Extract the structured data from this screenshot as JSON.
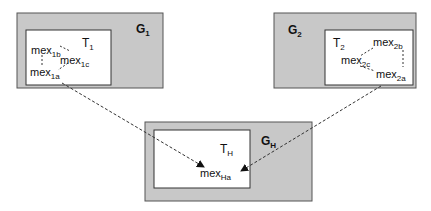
{
  "colors": {
    "outer_fill": "#c8c8c8",
    "outer_stroke": "#555555",
    "inner_fill": "#ffffff",
    "inner_stroke": "#333333",
    "link": "#333333"
  },
  "groups": [
    {
      "id": "G1",
      "label": "G",
      "label_sub": "1",
      "inner_label": "T",
      "inner_label_sub": "1",
      "nodes": [
        {
          "text": "mex",
          "sub": "1b"
        },
        {
          "text": "mex",
          "sub": "1c"
        },
        {
          "text": "mex",
          "sub": "1a"
        }
      ]
    },
    {
      "id": "G2",
      "label": "G",
      "label_sub": "2",
      "inner_label": "T",
      "inner_label_sub": "2",
      "nodes": [
        {
          "text": "mex",
          "sub": "2b"
        },
        {
          "text": "mex",
          "sub": "2c"
        },
        {
          "text": "mex",
          "sub": "2a"
        }
      ]
    },
    {
      "id": "GH",
      "label": "G",
      "label_sub": "H",
      "inner_label": "T",
      "inner_label_sub": "H",
      "nodes": [
        {
          "text": "mex",
          "sub": "Ha"
        }
      ]
    }
  ],
  "links": [
    {
      "from": "mex1a",
      "to": "mexHa",
      "style": "dashed-arrow"
    },
    {
      "from": "mex2a",
      "to": "mexHa",
      "style": "dashed-arrow"
    }
  ]
}
